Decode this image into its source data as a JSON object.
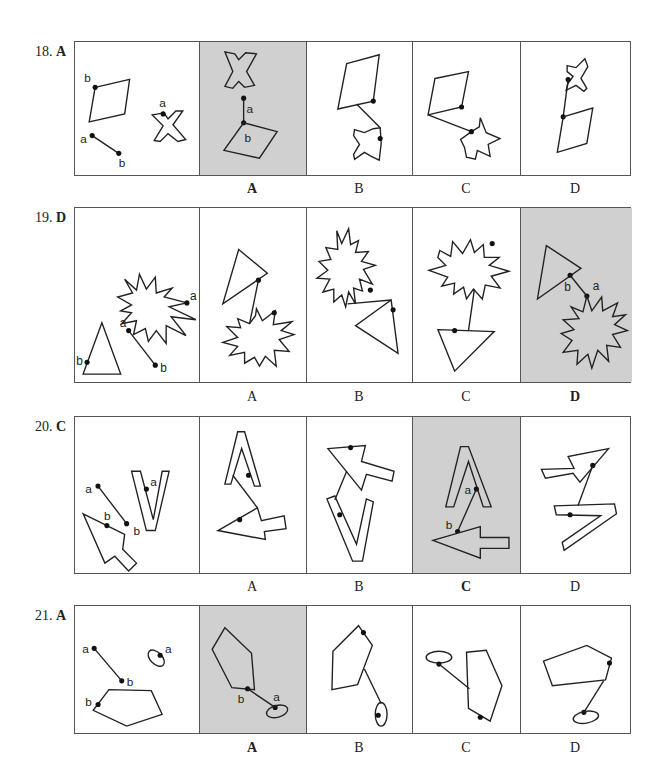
{
  "questions": [
    {
      "number": "18.",
      "answer": "A",
      "options": [
        {
          "label": "A",
          "selected": true
        },
        {
          "label": "B",
          "selected": false
        },
        {
          "label": "C",
          "selected": false
        },
        {
          "label": "D",
          "selected": false
        }
      ],
      "stem_labels": {
        "point_a": "a",
        "point_b": "b"
      }
    },
    {
      "number": "19.",
      "answer": "D",
      "options": [
        {
          "label": "A",
          "selected": false
        },
        {
          "label": "B",
          "selected": false
        },
        {
          "label": "C",
          "selected": false
        },
        {
          "label": "D",
          "selected": true
        }
      ],
      "stem_labels": {
        "point_a": "a",
        "point_b": "b"
      }
    },
    {
      "number": "20.",
      "answer": "C",
      "options": [
        {
          "label": "A",
          "selected": false
        },
        {
          "label": "B",
          "selected": false
        },
        {
          "label": "C",
          "selected": true
        },
        {
          "label": "D",
          "selected": false
        }
      ],
      "stem_labels": {
        "point_a": "a",
        "point_b": "b"
      }
    },
    {
      "number": "21.",
      "answer": "A",
      "options": [
        {
          "label": "A",
          "selected": true
        },
        {
          "label": "B",
          "selected": false
        },
        {
          "label": "C",
          "selected": false
        },
        {
          "label": "D",
          "selected": false
        }
      ],
      "stem_labels": {
        "point_a": "a",
        "point_b": "b"
      }
    }
  ],
  "colors": {
    "shaded_panel": "#d0d0d0",
    "stroke": "#222222",
    "background": "#ffffff"
  }
}
